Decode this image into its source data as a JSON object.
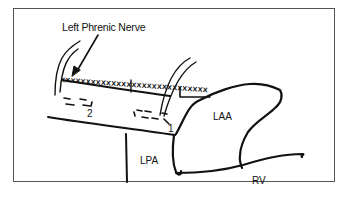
{
  "diagram": {
    "labels": {
      "nerve": "Left Phrenic Nerve",
      "site_1": "1",
      "site_2": "2",
      "laa": "LAA",
      "lpa": "LPA",
      "rv": "RV"
    },
    "ablation_marks": "xxxxxxxxxxxxxxxxxxxxxxxxxxxxx",
    "colors": {
      "stroke": "#111111",
      "frame": "#555555",
      "background": "#ffffff"
    }
  }
}
